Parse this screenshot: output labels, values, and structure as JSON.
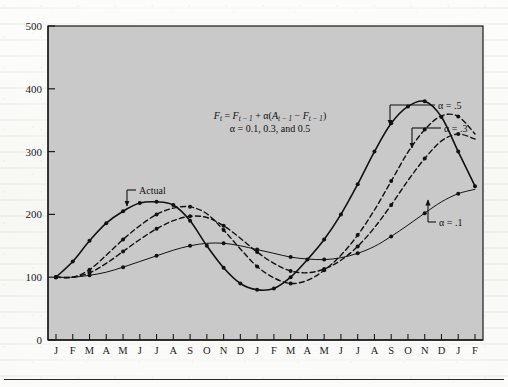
{
  "figure": {
    "plot_bg_color": "#c9c9c9",
    "axis_color": "#1a1a1a",
    "series_color": "#111111"
  },
  "annotations": {
    "actual_label": "Actual",
    "alpha_5_label": "α = .5",
    "alpha_3_label": "α = .3",
    "alpha_1_label": "α = .1",
    "formula_line1_parts": {
      "f": "F",
      "t": "t",
      "eq": " = ",
      "f2": "F",
      "tm1": "t − 1",
      "plus": " + ",
      "alpha": "α",
      "open": "(",
      "a": "A",
      "tm1b": "t − 1",
      "minus": " − ",
      "f3": "F",
      "tm1c": "t − 1",
      "close": ")"
    },
    "formula_line2": "α = 0.1, 0.3, and 0.5"
  },
  "chart_data": {
    "type": "line",
    "title": "",
    "xlabel": "",
    "ylabel": "",
    "ylim": [
      0,
      500
    ],
    "yticks": [
      0,
      100,
      200,
      300,
      400,
      500
    ],
    "ytick_labels": [
      "0",
      "100",
      "200",
      "300",
      "400",
      "500"
    ],
    "grid": false,
    "legend": "inline-annotations",
    "categories": [
      "J",
      "F",
      "M",
      "A",
      "M",
      "J",
      "J",
      "A",
      "S",
      "O",
      "N",
      "D",
      "J",
      "F",
      "M",
      "A",
      "M",
      "J",
      "J",
      "A",
      "S",
      "O",
      "N",
      "D",
      "J",
      "F"
    ],
    "series": [
      {
        "name": "Actual",
        "style": "solid",
        "markers": true,
        "values": [
          100,
          125,
          158,
          186,
          205,
          218,
          220,
          215,
          190,
          150,
          115,
          90,
          80,
          82,
          100,
          128,
          160,
          200,
          248,
          300,
          345,
          372,
          380,
          355,
          300,
          245
        ]
      },
      {
        "name": "α = .5",
        "style": "dashed",
        "markers": true,
        "values": [
          100,
          100,
          112,
          135,
          160,
          182,
          200,
          210,
          212,
          201,
          175,
          145,
          117,
          99,
          90,
          95,
          111,
          135,
          167,
          207,
          253,
          299,
          335,
          357,
          356,
          328
        ]
      },
      {
        "name": "α = .3",
        "style": "dashed",
        "markers": true,
        "values": [
          100,
          100,
          107,
          122,
          141,
          160,
          177,
          190,
          197,
          195,
          182,
          162,
          140,
          122,
          110,
          107,
          113,
          127,
          149,
          179,
          215,
          254,
          289,
          317,
          328,
          320
        ]
      },
      {
        "name": "α = .1",
        "style": "solid-thin",
        "markers": true,
        "values": [
          100,
          100,
          103,
          108,
          116,
          125,
          134,
          143,
          150,
          154,
          154,
          150,
          144,
          138,
          132,
          129,
          128,
          131,
          138,
          149,
          165,
          183,
          202,
          220,
          233,
          240
        ]
      }
    ]
  }
}
